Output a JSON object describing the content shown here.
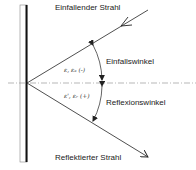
{
  "diagram": {
    "labels": {
      "incident_ray": "Einfallender Strahl",
      "incidence_angle": "Einfallswinkel",
      "reflection_angle": "Reflexionswinkel",
      "reflected_ray": "Reflektierter Strahl"
    },
    "symbols": {
      "incidence": "ε, εₑ (-)",
      "reflection": "ε', εᵣ (+)"
    }
  }
}
